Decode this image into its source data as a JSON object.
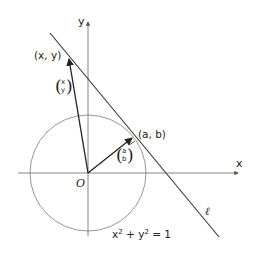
{
  "diagram": {
    "axes": {
      "x_label": "x",
      "y_label": "y",
      "origin_label": "O"
    },
    "circle": {
      "equation_lhs": "x",
      "equation_sup1": "2",
      "equation_plus": " + y",
      "equation_sup2": "2",
      "equation_rhs": " = 1"
    },
    "points": {
      "tangent_point_label": "(a, b)",
      "outer_point_label": "(x, y)"
    },
    "vectors": {
      "tangent_vector_top": "a",
      "tangent_vector_bottom": "b",
      "outer_vector_top": "x",
      "outer_vector_bottom": "y"
    },
    "line": {
      "label": "ℓ"
    },
    "colors": {
      "axis": "#777777",
      "circle": "#888888",
      "line": "#333333",
      "vector": "#222222"
    }
  }
}
